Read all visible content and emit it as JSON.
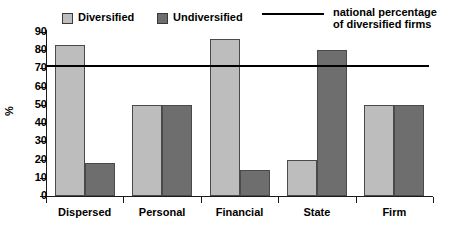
{
  "chart_data": {
    "type": "bar",
    "title": "",
    "subtitle": "",
    "xlabel": "",
    "ylabel": "%",
    "ylim": [
      0,
      90
    ],
    "ytick_labels": [
      "0",
      "10",
      "20",
      "30",
      "40",
      "50",
      "60",
      "70",
      "80",
      "90"
    ],
    "ytick_values": [
      0,
      10,
      20,
      30,
      40,
      50,
      60,
      70,
      80,
      90
    ],
    "grid": false,
    "legend_position": "top",
    "categories": [
      "Dispersed",
      "Personal",
      "Financial",
      "State",
      "Firm"
    ],
    "series": [
      {
        "name": "Diversified",
        "color": "#bdbdbd",
        "values": [
          83,
          50,
          86,
          20,
          50
        ]
      },
      {
        "name": "Undiversified",
        "color": "#6e6e6e",
        "values": [
          18,
          50,
          14,
          80,
          50
        ]
      }
    ],
    "reference_line": {
      "label_line1": "national percentage",
      "label_line2": "of diversified firms",
      "value": 72,
      "color": "#000000"
    }
  },
  "legend": {
    "entries": [
      {
        "label": "Diversified",
        "marker": "light-square-swatch"
      },
      {
        "label": "Undiversified",
        "marker": "dark-square-swatch"
      },
      {
        "label_line1": "national percentage",
        "label_line2": "of diversified firms",
        "marker": "horizontal-line-swatch"
      }
    ]
  }
}
